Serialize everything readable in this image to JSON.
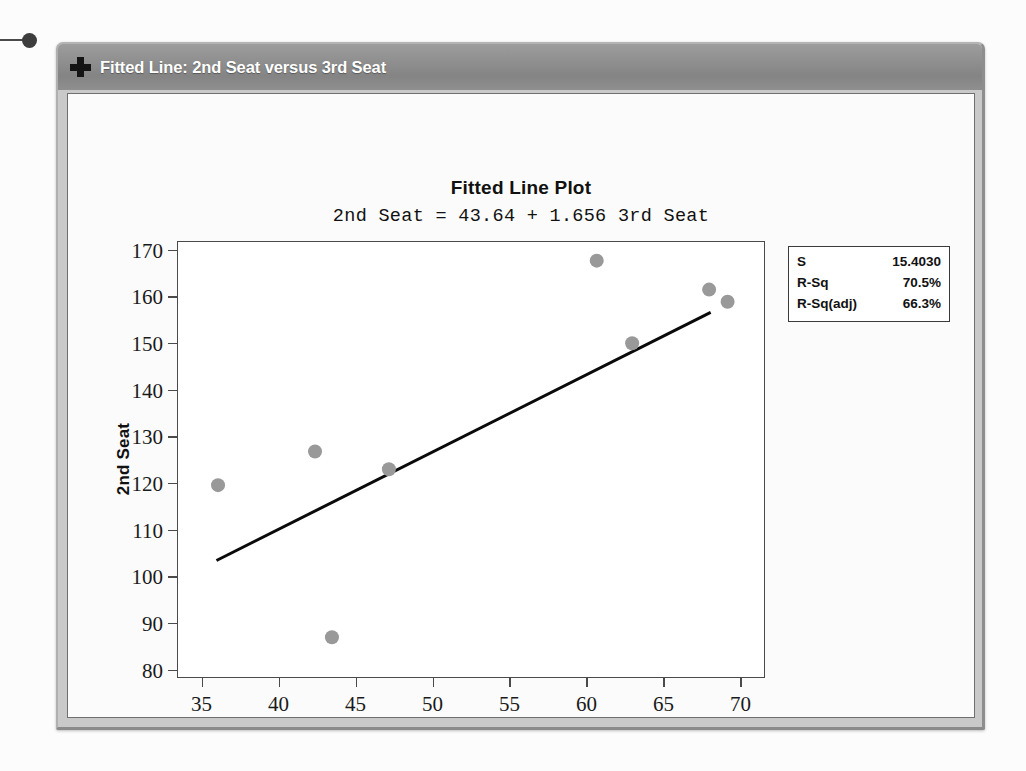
{
  "window": {
    "title": "Fitted Line: 2nd Seat versus 3rd Seat",
    "icon": "plus-icon"
  },
  "chart_data": {
    "type": "scatter",
    "title": "Fitted Line Plot",
    "subtitle": "2nd Seat = 43.64 + 1.656 3rd Seat",
    "xlabel": "3rd Seat",
    "ylabel": "2nd Seat",
    "xlim": [
      33.5,
      71.5
    ],
    "ylim": [
      78.5,
      171.5
    ],
    "xticks": [
      35,
      40,
      45,
      50,
      55,
      60,
      65,
      70
    ],
    "yticks": [
      80,
      90,
      100,
      110,
      120,
      130,
      140,
      150,
      160,
      170
    ],
    "grid": false,
    "legend_position": "outside-right-top",
    "point_color": "#999999",
    "line_color": "#0a0a0a",
    "points": [
      {
        "x": 36.1,
        "y": 119.4
      },
      {
        "x": 42.4,
        "y": 126.6
      },
      {
        "x": 43.5,
        "y": 86.8
      },
      {
        "x": 47.2,
        "y": 122.8
      },
      {
        "x": 60.7,
        "y": 167.5
      },
      {
        "x": 63.0,
        "y": 149.8
      },
      {
        "x": 68.0,
        "y": 161.3
      },
      {
        "x": 69.2,
        "y": 158.7
      }
    ],
    "fit_line": {
      "intercept": 43.64,
      "slope": 1.656,
      "x_start": 36.0,
      "x_end": 68.1
    },
    "annotations": {
      "stats": [
        {
          "label": "S",
          "value": "15.4030"
        },
        {
          "label": "R-Sq",
          "value": "70.5%"
        },
        {
          "label": "R-Sq(adj)",
          "value": "66.3%"
        }
      ]
    }
  }
}
